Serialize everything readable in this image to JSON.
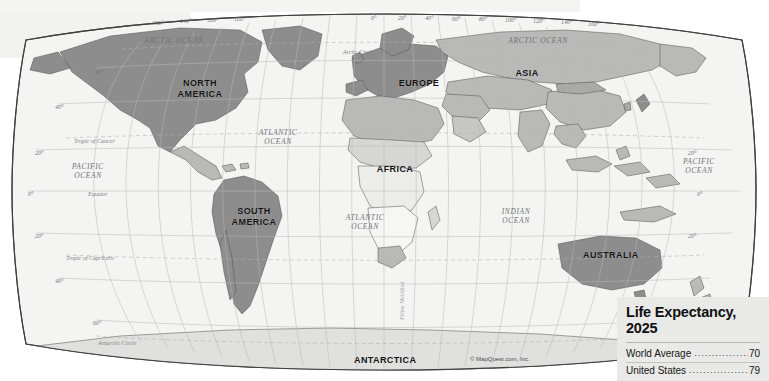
{
  "document": {
    "type": "world-map",
    "credit": "© MapQuest.com, Inc."
  },
  "map": {
    "continents": [
      {
        "name": "north-america",
        "lines": [
          "NORTH",
          "AMERICA"
        ],
        "x": 170,
        "y": 78,
        "w": 60
      },
      {
        "name": "south-america",
        "lines": [
          "SOUTH",
          "AMERICA"
        ],
        "x": 228,
        "y": 206,
        "w": 52
      },
      {
        "name": "europe",
        "lines": [
          "EUROPE"
        ],
        "x": 396,
        "y": 78,
        "w": 46
      },
      {
        "name": "africa",
        "lines": [
          "AFRICA"
        ],
        "x": 374,
        "y": 164,
        "w": 42
      },
      {
        "name": "asia",
        "lines": [
          "ASIA"
        ],
        "x": 511,
        "y": 68,
        "w": 32
      },
      {
        "name": "australia",
        "lines": [
          "AUSTRALIA"
        ],
        "x": 583,
        "y": 250,
        "w": 52
      },
      {
        "name": "antarctica",
        "lines": [
          "ANTARCTICA"
        ],
        "x": 354,
        "y": 355,
        "w": 62
      }
    ],
    "oceans": [
      {
        "name": "arctic-ocean-west",
        "lines": [
          "ARCTIC OCEAN"
        ],
        "x": 142,
        "y": 36,
        "w": 64
      },
      {
        "name": "arctic-ocean-east",
        "lines": [
          "ARCTIC OCEAN"
        ],
        "x": 506,
        "y": 36,
        "w": 64
      },
      {
        "name": "atlantic-ocean-north",
        "lines": [
          "ATLANTIC",
          "OCEAN"
        ],
        "x": 252,
        "y": 128,
        "w": 52
      },
      {
        "name": "atlantic-ocean-south",
        "lines": [
          "ATLANTIC",
          "OCEAN"
        ],
        "x": 339,
        "y": 213,
        "w": 52
      },
      {
        "name": "pacific-ocean-west",
        "lines": [
          "PACIFIC",
          "OCEAN"
        ],
        "x": 60,
        "y": 162,
        "w": 56
      },
      {
        "name": "pacific-ocean-east",
        "lines": [
          "PACIFIC",
          "OCEAN"
        ],
        "x": 677,
        "y": 157,
        "w": 44
      },
      {
        "name": "indian-ocean",
        "lines": [
          "INDIAN",
          "OCEAN"
        ],
        "x": 494,
        "y": 207,
        "w": 44
      }
    ],
    "special_lines": [
      {
        "name": "arctic-circle",
        "label": "Arctic Circle",
        "x": 343,
        "y": 49
      },
      {
        "name": "tropic-of-cancer",
        "label": "Tropic of Cancer",
        "x": 74,
        "y": 138
      },
      {
        "name": "equator",
        "label": "Equator",
        "x": 88,
        "y": 191
      },
      {
        "name": "tropic-of-capricorn",
        "label": "Tropic of Capricorn",
        "x": 66,
        "y": 255
      },
      {
        "name": "antarctic-circle",
        "label": "Antarctic Circle",
        "x": 98,
        "y": 340
      },
      {
        "name": "prime-meridian",
        "label": "Prime Meridian",
        "x": 399,
        "y": 320
      }
    ],
    "longitude_labels": [
      {
        "text": "160°",
        "x": 152,
        "y": 20
      },
      {
        "text": "140°",
        "x": 180,
        "y": 18
      },
      {
        "text": "120°",
        "x": 207,
        "y": 17
      },
      {
        "text": "100°",
        "x": 234,
        "y": 16
      },
      {
        "text": "0°",
        "x": 371,
        "y": 15
      },
      {
        "text": "20°",
        "x": 398,
        "y": 15
      },
      {
        "text": "40°",
        "x": 425,
        "y": 15
      },
      {
        "text": "60°",
        "x": 452,
        "y": 16
      },
      {
        "text": "80°",
        "x": 479,
        "y": 16
      },
      {
        "text": "100°",
        "x": 505,
        "y": 17
      },
      {
        "text": "120°",
        "x": 533,
        "y": 18
      },
      {
        "text": "140°",
        "x": 561,
        "y": 19
      },
      {
        "text": "160°",
        "x": 588,
        "y": 21
      }
    ],
    "latitude_labels_left": [
      {
        "text": "60°",
        "x": 95,
        "y": 69
      },
      {
        "text": "40°",
        "x": 55,
        "y": 104
      },
      {
        "text": "20°",
        "x": 35,
        "y": 150
      },
      {
        "text": "0°",
        "x": 28,
        "y": 191
      },
      {
        "text": "20°",
        "x": 35,
        "y": 233
      },
      {
        "text": "40°",
        "x": 55,
        "y": 278
      },
      {
        "text": "60°",
        "x": 93,
        "y": 320
      }
    ],
    "latitude_labels_right": [
      {
        "text": "20°",
        "x": 688,
        "y": 150
      },
      {
        "text": "0°",
        "x": 697,
        "y": 191
      },
      {
        "text": "20°",
        "x": 688,
        "y": 233
      }
    ]
  },
  "legend": {
    "title_line1": "Life Expectancy,",
    "title_line2": "2025",
    "dots": "..............................",
    "rows": [
      {
        "label": "World Average",
        "value": "70"
      },
      {
        "label": "United States",
        "value": "79"
      }
    ]
  },
  "colors": {
    "page_background": "#ffffff",
    "ocean_fill": "#f4f4f2",
    "land_unshaded": "#e3e3e0",
    "land_shaded": "#8d8d8d",
    "land_mid": "#b9b9b7",
    "outline": "#5a5a5a",
    "graticule": "#b9bcbe",
    "legend_background": "#e9e9e7",
    "legend_text": "#101010"
  }
}
